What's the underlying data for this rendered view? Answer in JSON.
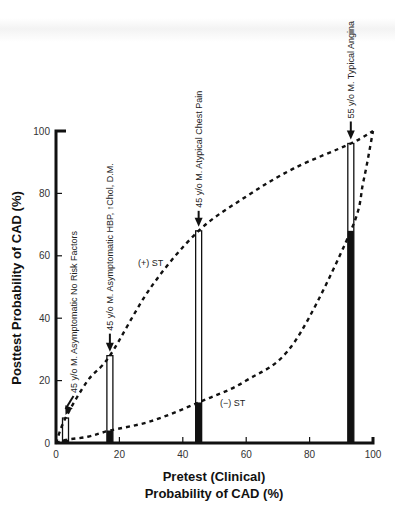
{
  "chart_data": {
    "type": "bar",
    "title": "",
    "xlabel": "Pretest (Clinical)\nProbability of CAD (%)",
    "xlabel_lines": [
      "Pretest (Clinical)",
      "Probability of CAD (%)"
    ],
    "ylabel": "Posttest Probability of CAD (%)",
    "xlim": [
      0,
      100
    ],
    "ylim": [
      0,
      100
    ],
    "x_ticks": [
      0,
      20,
      40,
      60,
      80,
      100
    ],
    "y_ticks": [
      0,
      20,
      40,
      60,
      80,
      100
    ],
    "grid": false,
    "legend": null,
    "bars": [
      {
        "label": "45 y/o M. Asymptomatic No Risk Factors",
        "pretest": 3,
        "posttest_positive_st": 8,
        "posttest_negative_st": 1
      },
      {
        "label": "45 y/o M. Asymptomatic HBP, ↑Chol, D.M.",
        "pretest": 17,
        "posttest_positive_st": 28,
        "posttest_negative_st": 4
      },
      {
        "label": "45 y/o M. Atypical Chest Pain",
        "pretest": 45,
        "posttest_positive_st": 68,
        "posttest_negative_st": 13
      },
      {
        "label": "55 y/o M. Typical Angina",
        "pretest": 93,
        "posttest_positive_st": 96,
        "posttest_negative_st": 68
      }
    ],
    "series": [
      {
        "name": "(+) ST",
        "style": "dashed",
        "x": [
          0,
          3,
          10,
          17,
          30,
          45,
          60,
          75,
          93,
          100
        ],
        "values": [
          0,
          8,
          20,
          28,
          50,
          68,
          79,
          88,
          96,
          100
        ]
      },
      {
        "name": "(−) ST",
        "style": "dashed",
        "x": [
          0,
          3,
          10,
          17,
          30,
          45,
          60,
          75,
          93,
          97,
          100
        ],
        "values": [
          0,
          1,
          2,
          4,
          7,
          13,
          20,
          32,
          68,
          84,
          100
        ]
      }
    ],
    "curve_labels": {
      "positive": "(+) ST",
      "negative": "(−) ST"
    },
    "annotations": [
      "45 y/o M. Asymptomatic No Risk Factors",
      "45 y/o M. Asymptomatic HBP, ↑Chol, D.M.",
      "45 y/o M. Atypical Chest Pain",
      "55 y/o M. Typical Angina"
    ],
    "colors": {
      "ink": "#111111",
      "bar_open": "#ffffff",
      "bar_filled": "#111111"
    }
  }
}
